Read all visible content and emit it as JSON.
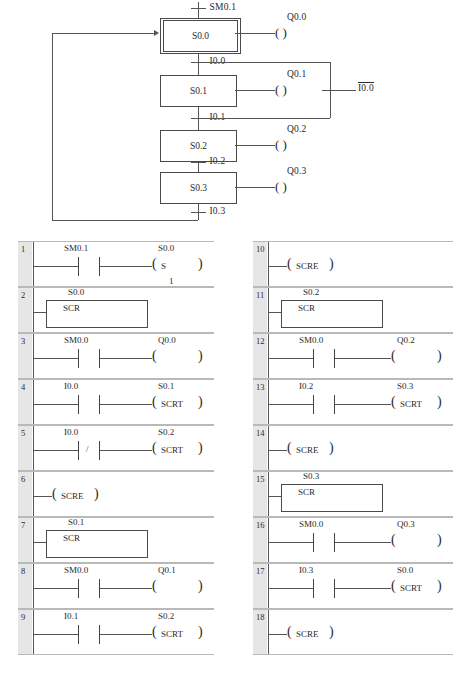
{
  "diagram": {
    "type": "plc-ladder-sfc",
    "sfc": {
      "initial_step": "S0.0",
      "steps": [
        {
          "name": "S0.0",
          "initial": true,
          "action": "Q0.0"
        },
        {
          "name": "S0.1",
          "initial": false,
          "action": "Q0.1"
        },
        {
          "name": "S0.2",
          "initial": false,
          "action": "Q0.2"
        },
        {
          "name": "S0.3",
          "initial": false,
          "action": "Q0.3"
        }
      ],
      "transitions": [
        {
          "label": "SM0.1",
          "from": "start",
          "to": "S0.0",
          "negated": false
        },
        {
          "label": "I0.0",
          "from": "S0.0",
          "to": "S0.1",
          "negated": false
        },
        {
          "label": "I0.1",
          "from": "S0.1",
          "to": "S0.2",
          "negated": false
        },
        {
          "label": "I0.2",
          "from": "S0.2",
          "to": "S0.3",
          "negated": false
        },
        {
          "label": "I0.3",
          "from": "S0.3",
          "to": "S0.0",
          "negated": false
        }
      ],
      "branch_transition": {
        "label": "I0.0",
        "negated": true
      }
    }
  },
  "ladder": {
    "left_column": [
      {
        "number": "1",
        "type": "contact-coil",
        "contact": {
          "tag": "SM0.1",
          "normally_closed": false
        },
        "coil": {
          "tag": "S0.0",
          "op": "S",
          "operand": "1"
        }
      },
      {
        "number": "2",
        "type": "scr-box",
        "box_tag": "S0.0",
        "box_text": "SCR"
      },
      {
        "number": "3",
        "type": "contact-coil",
        "contact": {
          "tag": "SM0.0",
          "normally_closed": false
        },
        "coil": {
          "tag": "Q0.0",
          "op": "",
          "operand": ""
        }
      },
      {
        "number": "4",
        "type": "contact-coil",
        "contact": {
          "tag": "I0.0",
          "normally_closed": false
        },
        "coil": {
          "tag": "S0.1",
          "op": "SCRT",
          "operand": ""
        }
      },
      {
        "number": "5",
        "type": "contact-coil",
        "contact": {
          "tag": "I0.0",
          "normally_closed": true
        },
        "coil": {
          "tag": "S0.2",
          "op": "SCRT",
          "operand": ""
        }
      },
      {
        "number": "6",
        "type": "coil-only",
        "coil": {
          "tag": "",
          "op": "SCRE",
          "operand": ""
        }
      },
      {
        "number": "7",
        "type": "scr-box",
        "box_tag": "S0.1",
        "box_text": "SCR"
      },
      {
        "number": "8",
        "type": "contact-coil",
        "contact": {
          "tag": "SM0.0",
          "normally_closed": false
        },
        "coil": {
          "tag": "Q0.1",
          "op": "",
          "operand": ""
        }
      },
      {
        "number": "9",
        "type": "contact-coil",
        "contact": {
          "tag": "I0.1",
          "normally_closed": false
        },
        "coil": {
          "tag": "S0.2",
          "op": "SCRT",
          "operand": ""
        }
      }
    ],
    "right_column": [
      {
        "number": "10",
        "type": "coil-only",
        "coil": {
          "tag": "",
          "op": "SCRE",
          "operand": ""
        }
      },
      {
        "number": "11",
        "type": "scr-box",
        "box_tag": "S0.2",
        "box_text": "SCR"
      },
      {
        "number": "12",
        "type": "contact-coil",
        "contact": {
          "tag": "SM0.0",
          "normally_closed": false
        },
        "coil": {
          "tag": "Q0.2",
          "op": "",
          "operand": ""
        }
      },
      {
        "number": "13",
        "type": "contact-coil",
        "contact": {
          "tag": "I0.2",
          "normally_closed": false
        },
        "coil": {
          "tag": "S0.3",
          "op": "SCRT",
          "operand": ""
        }
      },
      {
        "number": "14",
        "type": "coil-only",
        "coil": {
          "tag": "",
          "op": "SCRE",
          "operand": ""
        }
      },
      {
        "number": "15",
        "type": "scr-box",
        "box_tag": "S0.3",
        "box_text": "SCR"
      },
      {
        "number": "16",
        "type": "contact-coil",
        "contact": {
          "tag": "SM0.0",
          "normally_closed": false
        },
        "coil": {
          "tag": "Q0.3",
          "op": "",
          "operand": ""
        }
      },
      {
        "number": "17",
        "type": "contact-coil",
        "contact": {
          "tag": "I0.3",
          "normally_closed": false
        },
        "coil": {
          "tag": "S0.0",
          "op": "SCRT",
          "operand": ""
        }
      },
      {
        "number": "18",
        "type": "coil-only",
        "coil": {
          "tag": "",
          "op": "SCRE",
          "operand": ""
        }
      }
    ]
  },
  "colors": {
    "line": "#555555",
    "gutter": "#e6e6e6",
    "separator": "#b9b9b9",
    "text": "#2a2a2a"
  }
}
